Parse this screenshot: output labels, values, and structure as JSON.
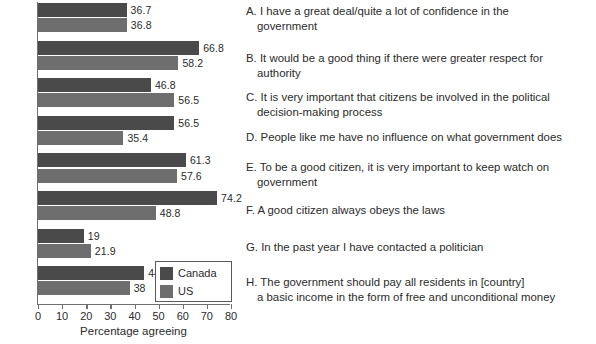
{
  "chart_data": {
    "type": "bar",
    "orientation": "horizontal",
    "title": "",
    "xlabel": "Percentage agreeing",
    "ylabel": "",
    "xlim": [
      0,
      80
    ],
    "xticks": [
      0,
      10,
      20,
      30,
      40,
      50,
      60,
      70,
      80
    ],
    "grid": false,
    "legend_position": "inside-bottom-right",
    "categories": [
      "A",
      "B",
      "C",
      "D",
      "E",
      "F",
      "G",
      "H"
    ],
    "series": [
      {
        "name": "Canada",
        "color": "#4a4a4a",
        "values": [
          36.7,
          66.8,
          46.8,
          56.5,
          61.3,
          74.2,
          19,
          44
        ]
      },
      {
        "name": "US",
        "color": "#6e6e6e",
        "values": [
          36.8,
          58.2,
          56.5,
          35.4,
          57.6,
          48.8,
          21.9,
          38
        ]
      }
    ],
    "value_labels": {
      "Canada": [
        "36.7",
        "66.8",
        "46.8",
        "56.5",
        "61.3",
        "74.2",
        "19",
        "44"
      ],
      "US": [
        "36.8",
        "58.2",
        "56.5",
        "35.4",
        "57.6",
        "48.8",
        "21.9",
        "38"
      ]
    }
  },
  "legend": {
    "items": [
      {
        "label": "Canada",
        "color": "#4a4a4a",
        "swatch_name": "canada-swatch"
      },
      {
        "label": "US",
        "color": "#6e6e6e",
        "swatch_name": "us-swatch"
      }
    ]
  },
  "axis": {
    "x_title": "Percentage agreeing",
    "x_tick_labels": [
      "0",
      "10",
      "20",
      "30",
      "40",
      "50",
      "60",
      "70",
      "80"
    ]
  },
  "key_items": [
    {
      "letter": "A.",
      "line1": "I have a great deal/quite a lot of confidence in the",
      "line2": "government"
    },
    {
      "letter": "B.",
      "line1": "It would be a good thing if there were greater respect for",
      "line2": "authority"
    },
    {
      "letter": "C.",
      "line1": "It is very important that citizens be involved in the political",
      "line2": "decision-making process"
    },
    {
      "letter": "D.",
      "line1": "People like me have no influence on what government does",
      "line2": ""
    },
    {
      "letter": "E.",
      "line1": "To be a good citizen, it is very  important to keep watch on",
      "line2": "government"
    },
    {
      "letter": "F.",
      "line1": "A good citizen always obeys the laws",
      "line2": ""
    },
    {
      "letter": "G.",
      "line1": "In the past year I have contacted a politician",
      "line2": ""
    },
    {
      "letter": "H.",
      "line1": "The government should pay all residents in [country]",
      "line2": "a basic income in the form of free and unconditional money"
    }
  ]
}
